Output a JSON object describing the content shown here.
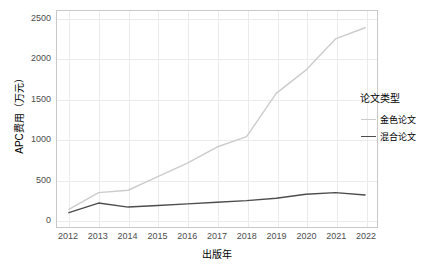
{
  "chart_data": {
    "type": "line",
    "title": "",
    "xlabel": "出版年",
    "ylabel": "APC费用（万元）",
    "x": [
      2012,
      2013,
      2014,
      2015,
      2016,
      2017,
      2018,
      2019,
      2020,
      2021,
      2022
    ],
    "xticklabels": [
      "2012",
      "2013",
      "2014",
      "2015",
      "2016",
      "2017",
      "2018",
      "2019",
      "2020",
      "2021",
      "2022"
    ],
    "yticklabels": [
      "0",
      "500",
      "1000",
      "1500",
      "2000",
      "2500"
    ],
    "yticks": [
      0,
      500,
      1000,
      1500,
      2000,
      2500
    ],
    "ylim": [
      0,
      2500
    ],
    "grid": true,
    "legend_position": "right",
    "legend_title": "论文类型",
    "series": [
      {
        "name": "金色论文",
        "color": "#cccccc",
        "values": [
          120,
          330,
          360,
          530,
          700,
          900,
          1030,
          1570,
          1860,
          2250,
          2390
        ]
      },
      {
        "name": "混合论文",
        "color": "#4d4d4d",
        "values": [
          80,
          200,
          150,
          170,
          190,
          210,
          230,
          260,
          310,
          330,
          300
        ]
      }
    ]
  }
}
